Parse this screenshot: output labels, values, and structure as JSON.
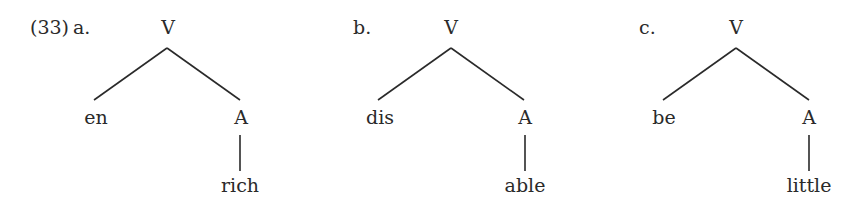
{
  "example": {
    "number": "(33)",
    "trees": [
      {
        "letter": "a.",
        "root": "V",
        "left_child": "en",
        "right_child": "A",
        "leaf": "rich"
      },
      {
        "letter": "b.",
        "root": "V",
        "left_child": "dis",
        "right_child": "A",
        "leaf": "able"
      },
      {
        "letter": "c.",
        "root": "V",
        "left_child": "be",
        "right_child": "A",
        "leaf": "little"
      }
    ]
  }
}
